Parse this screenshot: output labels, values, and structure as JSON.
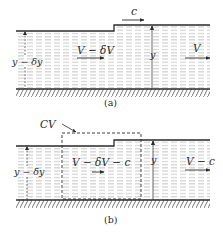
{
  "figure": {
    "panels": [
      {
        "id": "a",
        "caption": "(a)",
        "wave_speed_label": "c",
        "left_depth_label": "y − δy",
        "right_depth_label": "y",
        "left_velocity_label": "V − δV",
        "right_velocity_label": "V"
      },
      {
        "id": "b",
        "caption": "(b)",
        "control_volume_label": "CV",
        "left_depth_label": "y − δy",
        "right_depth_label": "y",
        "left_velocity_label": "V − δV − c",
        "right_velocity_label": "V − c"
      }
    ],
    "colors": {
      "ink": "#2a2a2a",
      "water_dash": "#9a9a9a",
      "background": "#ffffff"
    }
  }
}
